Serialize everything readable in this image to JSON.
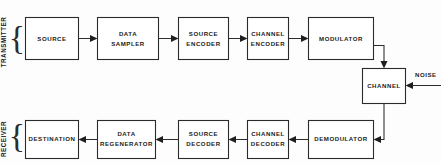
{
  "diagram": {
    "background_color": "#fdfdfd",
    "line_color": "#2b2b2b",
    "text_color": "#1a1a1a",
    "sections": [
      {
        "id": "transmitter",
        "label": "TRANSMITTER",
        "brace": "{"
      },
      {
        "id": "receiver",
        "label": "RECEIVER",
        "brace": "{"
      }
    ],
    "blocks": {
      "source": {
        "label_lines": [
          "SOURCE"
        ]
      },
      "data_sampler": {
        "label_lines": [
          "DATA",
          "SAMPLER"
        ]
      },
      "source_encoder": {
        "label_lines": [
          "SOURCE",
          "ENCODER"
        ]
      },
      "channel_encoder": {
        "label_lines": [
          "CHANNEL",
          "ENCODER"
        ]
      },
      "modulator": {
        "label_lines": [
          "MODULATOR"
        ]
      },
      "channel": {
        "label_lines": [
          "CHANNEL"
        ]
      },
      "demodulator": {
        "label_lines": [
          "DEMODULATOR"
        ]
      },
      "channel_decoder": {
        "label_lines": [
          "CHANNEL",
          "DECODER"
        ]
      },
      "source_decoder": {
        "label_lines": [
          "SOURCE",
          "DECODER"
        ]
      },
      "data_regenerator": {
        "label_lines": [
          "DATA",
          "REGENERATOR"
        ]
      },
      "destination": {
        "label_lines": [
          "DESTINATION"
        ]
      }
    },
    "annotations": {
      "noise": "NOISE"
    }
  }
}
